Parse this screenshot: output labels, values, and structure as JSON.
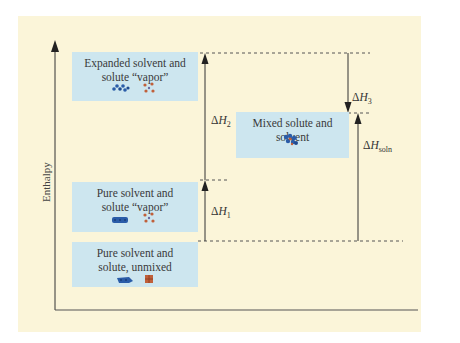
{
  "diagram": {
    "y_axis_label": "Enthalpy",
    "levels": [
      {
        "id": "expanded",
        "label_line1": "Expanded solvent and",
        "label_line2": "solute “vapor”",
        "icons": [
          "solvent-expanded-icon",
          "solute-vapor-icon"
        ]
      },
      {
        "id": "pure-vapor",
        "label_line1": "Pure solvent and",
        "label_line2": "solute “vapor”",
        "icons": [
          "solvent-pure-icon",
          "solute-vapor-icon"
        ]
      },
      {
        "id": "unmixed",
        "label_line1": "Pure solvent and",
        "label_line2": "solute, unmixed",
        "icons": [
          "solvent-pure-icon",
          "solute-solid-icon"
        ]
      },
      {
        "id": "mixed",
        "label_line1": "Mixed solute and solvent",
        "label_line2": "",
        "icons": [
          "mixed-solution-icon"
        ]
      }
    ],
    "arrows": [
      {
        "id": "dH1",
        "symbol": "Δ",
        "var": "H",
        "sub": "1",
        "direction": "up"
      },
      {
        "id": "dH2",
        "symbol": "Δ",
        "var": "H",
        "sub": "2",
        "direction": "up"
      },
      {
        "id": "dH3",
        "symbol": "Δ",
        "var": "H",
        "sub": "3",
        "direction": "down"
      },
      {
        "id": "dHsoln",
        "symbol": "Δ",
        "var": "H",
        "sub": "soln",
        "direction": "up"
      }
    ],
    "colors": {
      "background": "#fbf5d9",
      "box": "#cde6ef",
      "solvent": "#2a5ca8",
      "solute": "#c0603a",
      "line": "#333333"
    }
  }
}
